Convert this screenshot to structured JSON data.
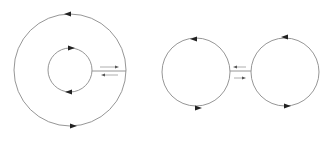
{
  "diagram": {
    "colors": {
      "line": "#8a8a8a",
      "arrowhead": "#222222",
      "background": "#ffffff"
    },
    "left": {
      "outer_circle": {
        "cx": 70,
        "cy": 70,
        "r": 56,
        "top_arrow": "left",
        "bottom_arrow": "right"
      },
      "inner_circle": {
        "cx": 70,
        "cy": 70,
        "r": 22,
        "top_arrow": "right",
        "bottom_arrow": "left"
      },
      "connector": {
        "y": 70,
        "x1": 92,
        "x2": 126,
        "upper_arrow": "right",
        "lower_arrow": "left"
      }
    },
    "right": {
      "left_circle": {
        "cx": 196,
        "cy": 72,
        "r": 34,
        "top_arrow": "left",
        "bottom_arrow": "right"
      },
      "right_circle": {
        "cx": 285,
        "cy": 72,
        "r": 34,
        "top_arrow": "left",
        "bottom_arrow": "right"
      },
      "connector": {
        "y": 72,
        "x1": 230,
        "x2": 251,
        "upper_arrow": "left",
        "lower_arrow": "right"
      }
    }
  }
}
